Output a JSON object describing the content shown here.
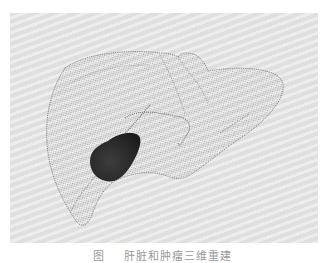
{
  "figure": {
    "background_color": "#e3e3e3",
    "mesh_color": "#6e6e6e",
    "lesion_color": "#2b2b2b",
    "caption": {
      "label": "图 ",
      "text": "肝脏和肿瘤三维重建",
      "truncated": true
    }
  }
}
